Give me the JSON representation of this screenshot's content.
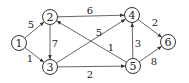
{
  "diagram": {
    "type": "weighted-directed-graph",
    "nodes": [
      {
        "id": "1",
        "label": "1",
        "x": 19,
        "y": 43
      },
      {
        "id": "2",
        "label": "2",
        "x": 50,
        "y": 17
      },
      {
        "id": "3",
        "label": "3",
        "x": 50,
        "y": 67
      },
      {
        "id": "4",
        "label": "4",
        "x": 132,
        "y": 15
      },
      {
        "id": "5",
        "label": "5",
        "x": 133,
        "y": 66
      },
      {
        "id": "6",
        "label": "6",
        "x": 168,
        "y": 42
      }
    ],
    "edges": [
      {
        "from": "1",
        "to": "2",
        "weight": "5",
        "lx": 31,
        "ly": 24
      },
      {
        "from": "1",
        "to": "3",
        "weight": "1",
        "lx": 30,
        "ly": 58
      },
      {
        "from": "2",
        "to": "3",
        "weight": "7",
        "lx": 55,
        "ly": 43
      },
      {
        "from": "2",
        "to": "4",
        "weight": "6",
        "lx": 90,
        "ly": 10
      },
      {
        "from": "3",
        "to": "4",
        "weight": "5",
        "lx": 99,
        "ly": 32
      },
      {
        "from": "5",
        "to": "2",
        "weight": "1",
        "lx": 111,
        "ly": 47
      },
      {
        "from": "3",
        "to": "5",
        "weight": "2",
        "lx": 90,
        "ly": 74
      },
      {
        "from": "5",
        "to": "4",
        "weight": "3",
        "lx": 138,
        "ly": 43
      },
      {
        "from": "4",
        "to": "6",
        "weight": "2",
        "lx": 155,
        "ly": 22
      },
      {
        "from": "5",
        "to": "6",
        "weight": "8",
        "lx": 154,
        "ly": 61
      }
    ]
  }
}
